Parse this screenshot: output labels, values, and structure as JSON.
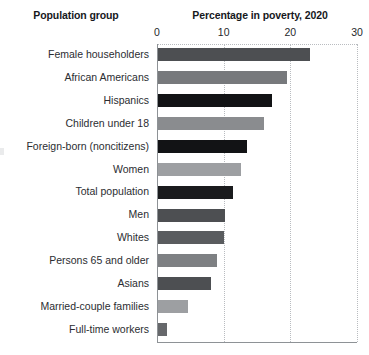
{
  "headers": {
    "category": "Population group",
    "value": "Percentage in poverty, 2020"
  },
  "chart_data": {
    "type": "bar",
    "orientation": "horizontal",
    "title": "Percentage in poverty, 2020",
    "xlabel": "Percentage in poverty, 2020",
    "ylabel": "Population group",
    "xlim": [
      0,
      30
    ],
    "ticks": [
      0,
      10,
      20,
      30
    ],
    "tick_labels": [
      "0",
      "10",
      "20",
      "30"
    ],
    "grid": "vertical-dotted",
    "legend": "none",
    "categories": [
      "Female householders",
      "African Americans",
      "Hispanics",
      "Children under 18",
      "Foreign-born (noncitizens)",
      "Women",
      "Total population",
      "Men",
      "Whites",
      "Persons 65 and older",
      "Asians",
      "Married-couple families",
      "Full-time workers"
    ],
    "values": [
      23.0,
      19.5,
      17.2,
      16.1,
      13.5,
      12.6,
      11.4,
      10.2,
      10.1,
      9.0,
      8.1,
      4.7,
      1.5
    ],
    "bar_colors": [
      "#4d4f52",
      "#77797c",
      "#121315",
      "#8a8c8f",
      "#121315",
      "#9d9fa2",
      "#1a1b1d",
      "#4d4f52",
      "#5a5c5f",
      "#7e8083",
      "#4d4f52",
      "#9d9fa2",
      "#66686b"
    ]
  },
  "colors": {
    "axis": "#8e9296",
    "gridline": "#b9bcc0",
    "text": "#2b2d31",
    "header_text": "#16181c",
    "background": "#ffffff"
  }
}
